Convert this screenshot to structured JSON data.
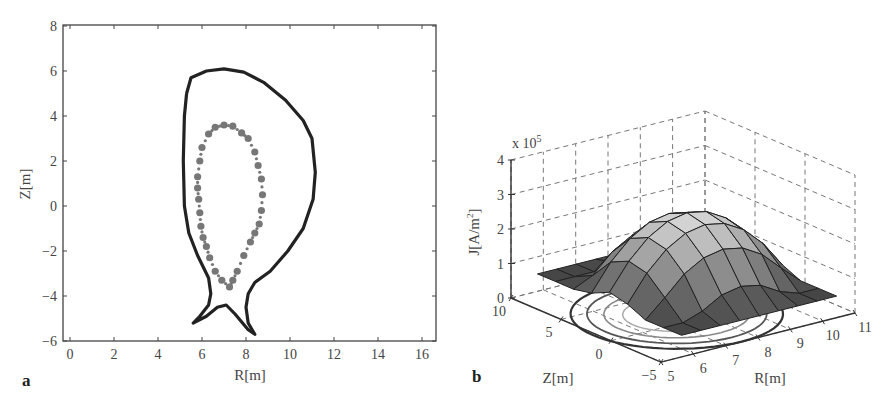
{
  "chart_data": [
    {
      "panel": "a",
      "type": "line",
      "xlabel": "R[m]",
      "ylabel": "Z[m]",
      "xlim": [
        -0.3,
        16.7
      ],
      "ylim": [
        -6,
        8
      ],
      "xticks": [
        0,
        2,
        4,
        6,
        8,
        10,
        12,
        14,
        16
      ],
      "yticks": [
        -6,
        -4,
        -2,
        0,
        2,
        4,
        6,
        8
      ],
      "grid": false,
      "series": [
        {
          "name": "outer boundary",
          "style": "solid-thick",
          "color": "#222222",
          "points": [
            [
              5.3,
              5.0
            ],
            [
              5.5,
              5.7
            ],
            [
              6.2,
              6.0
            ],
            [
              7.0,
              6.1
            ],
            [
              7.9,
              5.95
            ],
            [
              8.8,
              5.5
            ],
            [
              9.8,
              4.7
            ],
            [
              10.6,
              3.8
            ],
            [
              11.0,
              3.0
            ],
            [
              11.15,
              1.5
            ],
            [
              11.05,
              0.3
            ],
            [
              10.6,
              -1.0
            ],
            [
              9.9,
              -2.0
            ],
            [
              9.1,
              -2.9
            ],
            [
              8.4,
              -3.4
            ],
            [
              8.1,
              -3.9
            ],
            [
              8.0,
              -4.5
            ],
            [
              8.1,
              -5.2
            ],
            [
              8.4,
              -5.7
            ],
            [
              8.1,
              -5.5
            ],
            [
              7.5,
              -4.8
            ],
            [
              7.1,
              -4.4
            ],
            [
              6.7,
              -4.5
            ],
            [
              6.2,
              -4.9
            ],
            [
              5.6,
              -5.2
            ],
            [
              5.9,
              -4.9
            ],
            [
              6.3,
              -4.4
            ],
            [
              6.4,
              -3.9
            ],
            [
              6.3,
              -3.2
            ],
            [
              5.8,
              -2.2
            ],
            [
              5.4,
              -1.2
            ],
            [
              5.2,
              0.0
            ],
            [
              5.15,
              2.0
            ],
            [
              5.2,
              4.0
            ],
            [
              5.3,
              5.0
            ]
          ]
        },
        {
          "name": "inner contour",
          "style": "dotted-markers",
          "color": "#777777",
          "points": [
            [
              5.9,
              2.0
            ],
            [
              6.0,
              2.6
            ],
            [
              6.3,
              3.2
            ],
            [
              6.6,
              3.5
            ],
            [
              7.0,
              3.6
            ],
            [
              7.4,
              3.55
            ],
            [
              7.8,
              3.25
            ],
            [
              8.1,
              3.0
            ],
            [
              8.4,
              2.4
            ],
            [
              8.55,
              1.8
            ],
            [
              8.7,
              1.2
            ],
            [
              8.75,
              0.5
            ],
            [
              8.7,
              -0.2
            ],
            [
              8.6,
              -0.8
            ],
            [
              8.4,
              -1.2
            ],
            [
              8.2,
              -1.6
            ],
            [
              7.9,
              -2.2
            ],
            [
              7.6,
              -2.9
            ],
            [
              7.4,
              -3.3
            ],
            [
              7.25,
              -3.6
            ],
            [
              6.9,
              -3.3
            ],
            [
              6.6,
              -2.9
            ],
            [
              6.35,
              -2.3
            ],
            [
              6.2,
              -1.8
            ],
            [
              6.05,
              -1.4
            ],
            [
              5.95,
              -0.9
            ],
            [
              5.9,
              -0.3
            ],
            [
              5.85,
              0.3
            ],
            [
              5.8,
              0.8
            ],
            [
              5.8,
              1.3
            ]
          ]
        }
      ]
    },
    {
      "panel": "b",
      "type": "surface3d",
      "xlabel": "R[m]",
      "ylabel": "Z[m]",
      "zlabel": "J[A/m^2]",
      "zlabel_main": "J[A/m",
      "zlabel_sup": "2",
      "zlabel_tail": "]",
      "z_multiplier": "x 10",
      "z_multiplier_exp": "5",
      "xlim": [
        5,
        11
      ],
      "ylim": [
        -5,
        10
      ],
      "zlim": [
        0,
        4
      ],
      "xticks": [
        5,
        6,
        7,
        8,
        9,
        10,
        11
      ],
      "yticks": [
        -5,
        0,
        5,
        10
      ],
      "zticks": [
        0,
        1,
        2,
        3,
        4
      ],
      "grid": true,
      "peak_value": 3.0,
      "edge_value": 1.0,
      "description": "Dome-shaped current density surface peaking near R=7-8 m, Z=0 m at ~3e5 A/m^2, with contour projection on the base plane"
    }
  ],
  "labels": {
    "panel_a": "a",
    "panel_b": "b"
  }
}
